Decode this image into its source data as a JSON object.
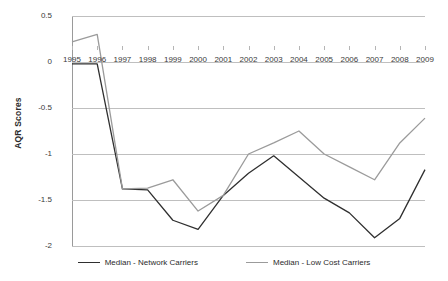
{
  "chart_data": {
    "type": "line",
    "title": "",
    "xlabel": "",
    "ylabel": "AQR Scores",
    "grid": true,
    "legend_position": "bottom",
    "ylim": [
      -2,
      0.5
    ],
    "yticks": [
      "0.5",
      "0",
      "-0.5",
      "-1",
      "-1.5",
      "-2"
    ],
    "ytick_values": [
      0.5,
      0,
      -0.5,
      -1,
      -1.5,
      -2
    ],
    "categories": [
      "1995",
      "1996",
      "1997",
      "1998",
      "1999",
      "2000",
      "2001",
      "2002",
      "2003",
      "2004",
      "2005",
      "2006",
      "2007",
      "2008",
      "2009"
    ],
    "series": [
      {
        "name": "Median - Network Carriers",
        "color": "#2f2f2f",
        "values": [
          -0.02,
          -0.02,
          -1.38,
          -1.39,
          -1.72,
          -1.82,
          -1.45,
          -1.21,
          -1.02,
          -1.25,
          -1.48,
          -1.64,
          -1.91,
          -1.7,
          -1.17
        ]
      },
      {
        "name": "Median - Low Cost Carriers",
        "color": "#9b9b9b",
        "values": [
          0.22,
          0.3,
          -1.38,
          -1.37,
          -1.28,
          -1.62,
          -1.45,
          -1.0,
          -0.88,
          -0.75,
          -1.0,
          -1.14,
          -1.28,
          -0.88,
          -0.61
        ]
      }
    ]
  },
  "colors": {
    "gridline": "#bfbfbf",
    "axis": "#9a9a9a",
    "text": "#2b2b2b",
    "background": "#ffffff"
  }
}
